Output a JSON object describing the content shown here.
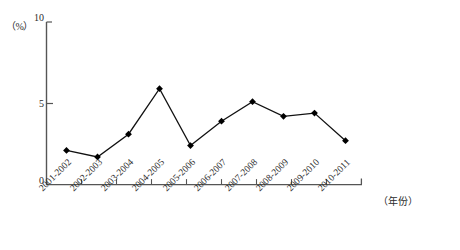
{
  "chart_data": {
    "type": "line",
    "title": "",
    "xlabel": "（年份）",
    "ylabel": "（%）",
    "ylim": [
      0,
      10
    ],
    "yticks": [
      0,
      5,
      10
    ],
    "ytick_labels": [
      "0",
      "5",
      "10"
    ],
    "grid": false,
    "legend": "none",
    "marker": "filled-diamond",
    "line_color": "#000000",
    "marker_color": "#000000",
    "axis_color": "#555555",
    "categories": [
      "2001-2002",
      "2002-2003",
      "2003-2004",
      "2004-2005",
      "2005-2006",
      "2006-2007",
      "2007-2008",
      "2008-2009",
      "2009-2010",
      "2010-2011"
    ],
    "values": [
      2.1,
      1.7,
      3.1,
      5.9,
      2.4,
      3.9,
      5.1,
      4.2,
      4.4,
      2.7
    ]
  },
  "axes": {
    "y_unit": "（%）",
    "x_title": "（年份）"
  }
}
